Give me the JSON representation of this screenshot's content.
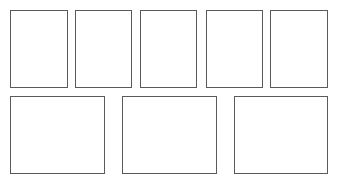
{
  "page": {
    "background_color": "#ffffff",
    "border_color": "#5a5a5a",
    "fill_color": "#ffffff",
    "width": 337,
    "height": 183
  },
  "rows": [
    {
      "name": "top-row",
      "orientation": "portrait",
      "count": 5,
      "frames": [
        {
          "label": "",
          "x": 10,
          "y": 10,
          "w": 58,
          "h": 78,
          "weight": "normal"
        },
        {
          "label": "",
          "x": 75,
          "y": 10,
          "w": 57,
          "h": 78,
          "weight": "normal"
        },
        {
          "label": "",
          "x": 140,
          "y": 10,
          "w": 57,
          "h": 78,
          "weight": "normal"
        },
        {
          "label": "",
          "x": 206,
          "y": 10,
          "w": 57,
          "h": 78,
          "weight": "normal"
        },
        {
          "label": "",
          "x": 270,
          "y": 10,
          "w": 58,
          "h": 78,
          "weight": "normal"
        }
      ]
    },
    {
      "name": "bottom-row",
      "orientation": "landscape",
      "count": 3,
      "frames": [
        {
          "label": "",
          "x": 10,
          "y": 96,
          "w": 95,
          "h": 78,
          "weight": "normal"
        },
        {
          "label": "",
          "x": 122,
          "y": 96,
          "w": 95,
          "h": 78,
          "weight": "normal"
        },
        {
          "label": "",
          "x": 234,
          "y": 96,
          "w": 94,
          "h": 78,
          "weight": "normal"
        }
      ]
    }
  ]
}
